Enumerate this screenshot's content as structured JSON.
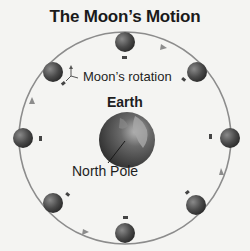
{
  "title": "The Moon’s Motion",
  "labels": {
    "moon_rotation": "Moon’s rotation",
    "earth": "Earth",
    "north_pole": "North Pole"
  },
  "orbit": {
    "cx": 125,
    "cy": 138,
    "r": 108,
    "color": "#8a8a8a",
    "direction": "counterclockwise"
  },
  "earth": {
    "cx": 127,
    "cy": 140,
    "r": 28
  },
  "moons": [
    {
      "position": "top",
      "cx": 125,
      "cy": 42
    },
    {
      "position": "top-right",
      "cx": 197,
      "cy": 73
    },
    {
      "position": "right",
      "cx": 230,
      "cy": 139
    },
    {
      "position": "bottom-right",
      "cx": 197,
      "cy": 205
    },
    {
      "position": "bottom",
      "cx": 125,
      "cy": 234
    },
    {
      "position": "bottom-left",
      "cx": 53,
      "cy": 204
    },
    {
      "position": "left",
      "cx": 23,
      "cy": 139
    },
    {
      "position": "top-left",
      "cx": 53,
      "cy": 72
    }
  ],
  "colors": {
    "moon": "#555555",
    "earth_ocean": "#3d3d3d",
    "earth_land": "#9a9a9a",
    "marker": "#444444"
  }
}
